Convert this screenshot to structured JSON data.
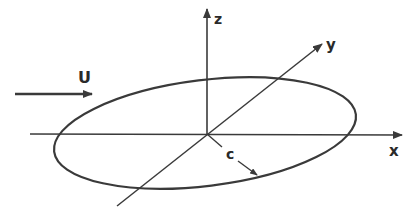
{
  "diagram": {
    "labels": {
      "flow": "U",
      "x_axis": "x",
      "y_axis": "y",
      "z_axis": "z",
      "radius": "c"
    },
    "colors": {
      "stroke": "#3a3a3a",
      "background": "#ffffff"
    }
  }
}
